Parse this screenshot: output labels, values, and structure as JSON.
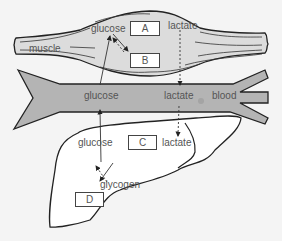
{
  "diagram": {
    "regions": {
      "muscle": "muscle",
      "blood": "blood",
      "liver": ""
    },
    "muscle_labels": {
      "glucose": "glucose",
      "lactate": "lactate",
      "muscle": "muscle"
    },
    "blood_labels": {
      "glucose": "glucose",
      "lactate": "lactate",
      "blood": "blood"
    },
    "liver_labels": {
      "glucose": "glucose",
      "lactate": "lactate",
      "glycogen": "glycogen"
    },
    "boxes": {
      "A": "A",
      "B": "B",
      "C": "C",
      "D": "D"
    },
    "colors": {
      "background": "#f4f4f4",
      "muscle_fill": "#dcdcdc",
      "blood_fill": "#b4b4b4",
      "liver_fill": "#ffffff",
      "outline": "#222222",
      "text": "#555555"
    }
  }
}
